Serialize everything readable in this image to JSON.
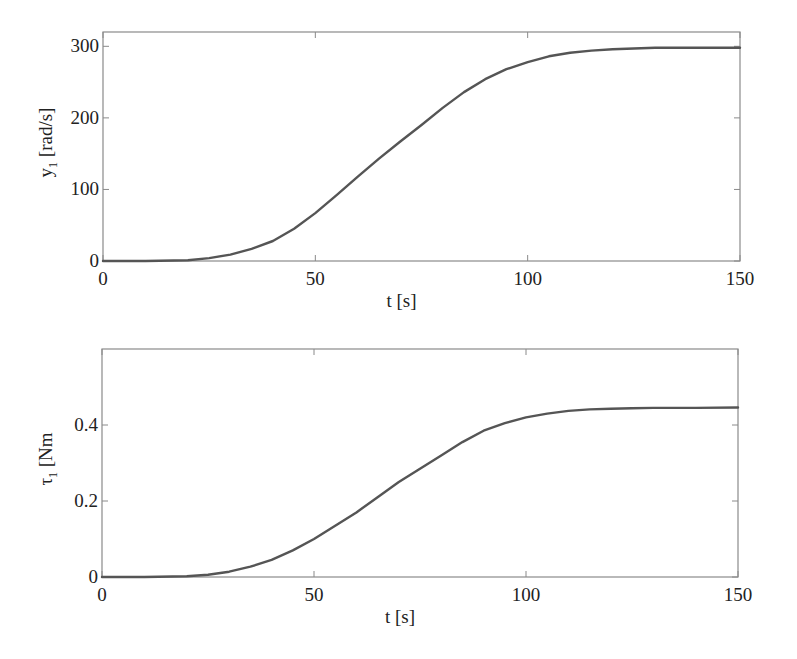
{
  "colors": {
    "line": "#555555",
    "axes": "#8a8a8a",
    "text": "#222222",
    "background": "#ffffff"
  },
  "chart_data": [
    {
      "type": "line",
      "title": "",
      "xlabel": "t [s]",
      "ylabel_main": "y",
      "ylabel_sub": "1",
      "ylabel_unit": "[rad/s]",
      "xlim": [
        0,
        150
      ],
      "ylim": [
        0,
        320
      ],
      "xticks": [
        0,
        50,
        100,
        150
      ],
      "xtick_labels": [
        "0",
        "50",
        "100",
        "150"
      ],
      "yticks": [
        0,
        100,
        200,
        300
      ],
      "ytick_labels": [
        "0",
        "100",
        "200",
        "300"
      ],
      "grid": false,
      "legend": null,
      "series": [
        {
          "name": "y1",
          "x": [
            0,
            10,
            20,
            25,
            30,
            35,
            40,
            45,
            50,
            55,
            60,
            65,
            70,
            75,
            80,
            85,
            90,
            95,
            100,
            105,
            110,
            115,
            120,
            125,
            130,
            140,
            150
          ],
          "y": [
            0,
            0,
            1,
            4,
            9,
            17,
            28,
            45,
            67,
            92,
            118,
            143,
            167,
            190,
            214,
            236,
            254,
            268,
            278,
            286,
            291,
            294,
            296,
            297,
            298,
            298,
            298
          ]
        }
      ]
    },
    {
      "type": "line",
      "title": "",
      "xlabel": "t [s]",
      "ylabel_main": "τ",
      "ylabel_sub": "1",
      "ylabel_unit": "[Nm",
      "xlim": [
        0,
        150
      ],
      "ylim": [
        0,
        0.6
      ],
      "xticks": [
        0,
        50,
        100,
        150
      ],
      "xtick_labels": [
        "0",
        "50",
        "100",
        "150"
      ],
      "yticks": [
        0,
        0.2,
        0.4
      ],
      "ytick_labels": [
        "0",
        "0.2",
        "0.4"
      ],
      "grid": false,
      "legend": null,
      "series": [
        {
          "name": "tau1",
          "x": [
            0,
            10,
            20,
            25,
            30,
            35,
            40,
            45,
            50,
            55,
            60,
            65,
            70,
            75,
            80,
            85,
            90,
            95,
            100,
            105,
            110,
            115,
            120,
            125,
            130,
            140,
            150
          ],
          "y": [
            0,
            0,
            0.002,
            0.006,
            0.014,
            0.027,
            0.045,
            0.07,
            0.1,
            0.135,
            0.17,
            0.21,
            0.25,
            0.285,
            0.32,
            0.355,
            0.385,
            0.405,
            0.42,
            0.43,
            0.437,
            0.441,
            0.443,
            0.444,
            0.445,
            0.445,
            0.446
          ]
        }
      ]
    }
  ]
}
